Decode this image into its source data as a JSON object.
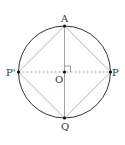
{
  "diagram": {
    "type": "geometry",
    "circle": {
      "cx": 64.5,
      "cy": 72,
      "r": 46
    },
    "points": {
      "A": {
        "label": "A",
        "x": 64.5,
        "y": 26
      },
      "P_prime": {
        "label": "P'",
        "x": 18.5,
        "y": 72
      },
      "P": {
        "label": "P",
        "x": 110.5,
        "y": 72
      },
      "O": {
        "label": "O",
        "x": 64.5,
        "y": 72
      },
      "Q": {
        "label": "Q",
        "x": 64.5,
        "y": 118
      }
    },
    "segments": [
      {
        "from": "A",
        "to": "Q",
        "style": "solid"
      },
      {
        "from": "P_prime",
        "to": "P",
        "style": "dashed"
      },
      {
        "from": "A",
        "to": "P",
        "style": "solid"
      },
      {
        "from": "P",
        "to": "Q",
        "style": "solid"
      },
      {
        "from": "Q",
        "to": "P_prime",
        "style": "solid"
      },
      {
        "from": "P_prime",
        "to": "A",
        "style": "solid"
      }
    ],
    "right_angle_at": "O",
    "colors": {
      "circle": "#333333",
      "square": "#aaaaaa",
      "diameter": "#999999",
      "dashed": "#999999",
      "points": "#111111"
    }
  }
}
